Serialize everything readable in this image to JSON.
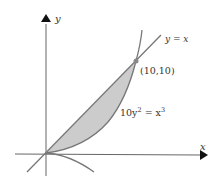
{
  "diagram": {
    "axes": {
      "x_label": "x",
      "y_label": "y"
    },
    "curves": [
      {
        "name": "line",
        "equation_label": "y = x"
      },
      {
        "name": "semicubical-parabola",
        "equation_label_base": "10y",
        "equation_label_exp1": "2",
        "equation_label_mid": " = x",
        "equation_label_exp2": "3"
      }
    ],
    "intersection_point": {
      "label": "(10,10)",
      "x": 10,
      "y": 10
    },
    "shaded_region": "between y = x and 10y^2 = x^3 from x = 0 to x = 10",
    "colors": {
      "axis": "#555555",
      "curve": "#777777",
      "fill": "#cccccc",
      "point": "#888888",
      "text": "#333333"
    }
  }
}
